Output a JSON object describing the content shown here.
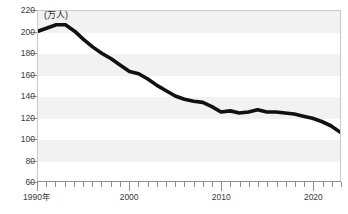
{
  "chart_data": {
    "type": "line",
    "title": "",
    "subtitle": "",
    "unit_label": "(万人)",
    "xlabel": "",
    "ylabel": "",
    "xlim": [
      1990,
      2023
    ],
    "ylim": [
      60,
      220
    ],
    "ytick_values": [
      60,
      80,
      100,
      120,
      140,
      160,
      180,
      200,
      220
    ],
    "ytick_labels": [
      "60",
      "80",
      "100",
      "120",
      "140",
      "160",
      "180",
      "200",
      "220"
    ],
    "xtick_values": [
      1990,
      2000,
      2010,
      2020
    ],
    "xtick_labels": [
      "1990年",
      "2000",
      "2010",
      "2020"
    ],
    "grid": false,
    "banded_background": true,
    "legend": null,
    "legend_position": "none",
    "line_color": "#111111",
    "line_width_px": 3.6,
    "band_color": "#f2f2f2",
    "axis_color": "#8f8f8f",
    "x": [
      1990,
      1991,
      1992,
      1993,
      1994,
      1995,
      1996,
      1997,
      1998,
      1999,
      2000,
      2001,
      2002,
      2003,
      2004,
      2005,
      2006,
      2007,
      2008,
      2009,
      2010,
      2011,
      2012,
      2013,
      2014,
      2015,
      2016,
      2017,
      2018,
      2019,
      2020,
      2021,
      2022,
      2023
    ],
    "values": [
      201,
      204,
      207,
      207,
      201,
      193,
      186,
      180,
      175,
      169,
      163,
      161,
      156,
      150,
      145,
      140,
      137,
      135,
      134,
      130,
      125,
      126,
      124,
      125,
      127,
      125,
      125,
      124,
      123,
      121,
      119,
      116,
      112,
      106
    ],
    "series": [
      {
        "name": "",
        "values": [
          201,
          204,
          207,
          207,
          201,
          193,
          186,
          180,
          175,
          169,
          163,
          161,
          156,
          150,
          145,
          140,
          137,
          135,
          134,
          130,
          125,
          126,
          124,
          125,
          127,
          125,
          125,
          124,
          123,
          121,
          119,
          116,
          112,
          106
        ]
      }
    ],
    "annotations": []
  }
}
